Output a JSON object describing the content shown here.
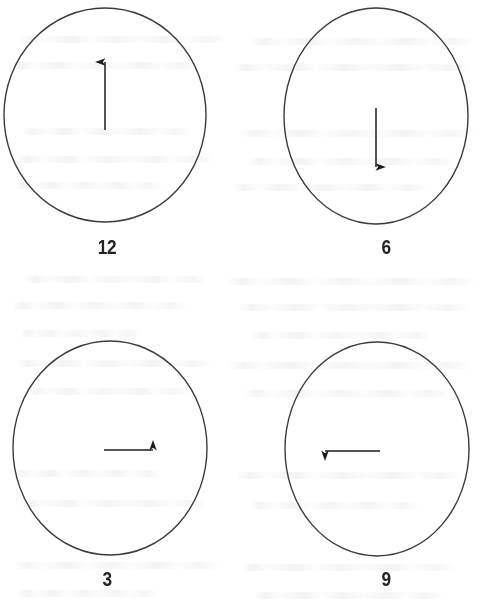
{
  "page": {
    "background_color": "#ffffff",
    "width": 493,
    "height": 613
  },
  "style": {
    "stroke_color": "#3a3a40",
    "arrow_color": "#1c1c20",
    "label_color": "#232326",
    "circle_stroke_width": 1.4,
    "arrow_stroke_width": 1.6
  },
  "figures": [
    {
      "id": "clock-12",
      "label": "12",
      "direction": "up",
      "arrow_glyph": "↑",
      "circle": {
        "cx": 105,
        "cy": 115,
        "rx": 101,
        "ry": 107
      },
      "arrow": {
        "x1": 105,
        "y1": 130,
        "x2": 105,
        "y2": 57
      }
    },
    {
      "id": "clock-6",
      "label": "6",
      "direction": "down",
      "arrow_glyph": "↓",
      "circle": {
        "cx": 376,
        "cy": 116,
        "rx": 92,
        "ry": 108
      },
      "arrow": {
        "x1": 376,
        "y1": 108,
        "x2": 376,
        "y2": 172
      }
    },
    {
      "id": "clock-3",
      "label": "3",
      "direction": "right",
      "arrow_glyph": "→",
      "circle": {
        "cx": 110,
        "cy": 450,
        "rx": 97,
        "ry": 107
      },
      "arrow": {
        "x1": 104,
        "y1": 452,
        "x2": 158,
        "y2": 452
      }
    },
    {
      "id": "clock-9",
      "label": "9",
      "direction": "left",
      "arrow_glyph": "←",
      "circle": {
        "cx": 377,
        "cy": 451,
        "rx": 92,
        "ry": 107
      },
      "arrow": {
        "x1": 380,
        "y1": 452,
        "x2": 320,
        "y2": 452
      }
    }
  ],
  "labels": {
    "top_left": "12",
    "top_right": "6",
    "bottom_left": "3",
    "bottom_right": "9"
  }
}
